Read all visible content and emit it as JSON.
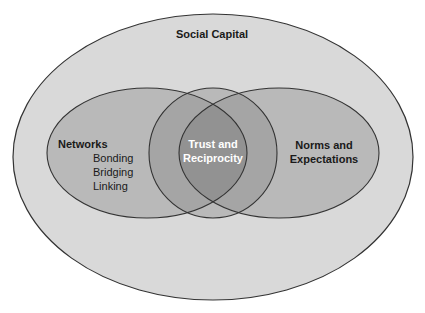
{
  "diagram": {
    "outer": {
      "label": "Social Capital"
    },
    "left": {
      "title": "Networks",
      "items": [
        "Bonding",
        "Bridging",
        "Linking"
      ]
    },
    "center": {
      "line1": "Trust and",
      "line2": "Reciprocity"
    },
    "right": {
      "line1": "Norms and",
      "line2": "Expectations"
    }
  },
  "colors": {
    "background": "#ffffff",
    "outer_fill": "#d9d9d9",
    "ellipse_fill": "#b9b9b9",
    "overlap_fill": "#a5a5a5",
    "center_fill": "#929292",
    "stroke": "#333333",
    "center_text": "#ffffff",
    "text": "#1a1a1a"
  }
}
